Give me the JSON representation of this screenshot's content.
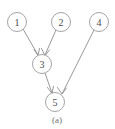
{
  "figure": {
    "caption": "(a)",
    "background_color": "#ffffff",
    "line_color": "#8d8d8d",
    "node_stroke_color": "#9a9a9a",
    "node_fill_color": "#ffffff",
    "label_color": "#4a4a4a",
    "caption_color": "#6f6f6f"
  },
  "diagram": {
    "type": "directed-graph",
    "node_radius": 9.5,
    "nodes": [
      {
        "id": "1",
        "label": "1",
        "cx": 17,
        "cy": 22
      },
      {
        "id": "2",
        "label": "2",
        "cx": 61,
        "cy": 22
      },
      {
        "id": "4",
        "label": "4",
        "cx": 99,
        "cy": 22
      },
      {
        "id": "3",
        "label": "3",
        "cx": 42,
        "cy": 64
      },
      {
        "id": "5",
        "label": "5",
        "cx": 55,
        "cy": 102
      }
    ],
    "edges": [
      {
        "from": "1",
        "to": "3",
        "directed": true,
        "x1": 23,
        "y1": 29,
        "x2": 38,
        "y2": 55
      },
      {
        "from": "2",
        "to": "3",
        "directed": true,
        "x1": 56,
        "y1": 30,
        "x2": 45,
        "y2": 55
      },
      {
        "from": "3",
        "to": "5",
        "directed": true,
        "x1": 45,
        "y1": 73,
        "x2": 52,
        "y2": 93
      },
      {
        "from": "4",
        "to": "5",
        "directed": true,
        "x1": 94,
        "y1": 30,
        "x2": 62,
        "y2": 94
      }
    ],
    "arrowheads": [
      {
        "at_node": "3",
        "from": "1",
        "left_x": 34,
        "left_y": 50,
        "tip_x": 38,
        "tip_y": 55,
        "right_x": 39,
        "right_y": 49
      },
      {
        "at_node": "3",
        "from": "2",
        "left_x": 42,
        "left_y": 49,
        "tip_x": 45,
        "tip_y": 55,
        "right_x": 49,
        "right_y": 50
      },
      {
        "at_node": "5",
        "from": "3",
        "left_x": 48,
        "left_y": 88,
        "tip_x": 52,
        "tip_y": 93,
        "right_x": 53,
        "right_y": 87
      },
      {
        "at_node": "5",
        "from": "4",
        "left_x": 58,
        "left_y": 88,
        "tip_x": 62,
        "tip_y": 94,
        "right_x": 66,
        "right_y": 88
      }
    ]
  }
}
